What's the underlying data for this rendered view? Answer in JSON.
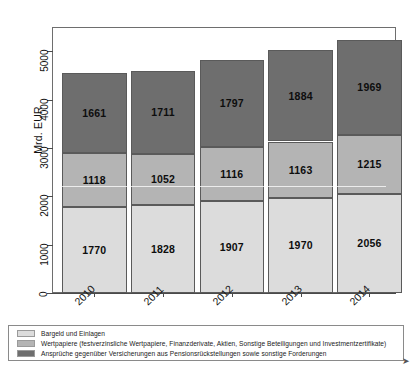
{
  "chart_data": {
    "type": "bar",
    "stacked": true,
    "title": "",
    "subtitle": "",
    "xlabel": "",
    "ylabel": "Mrd. EUR",
    "categories": [
      "2010",
      "2011",
      "2012",
      "2013",
      "2014"
    ],
    "ylim": [
      0,
      5500
    ],
    "yticks": [
      0,
      1000,
      2000,
      3000,
      4000,
      5000
    ],
    "ytick_labels": [
      "0",
      "1000",
      "2000",
      "3000",
      "4000",
      "5000"
    ],
    "grid": false,
    "legend_position": "below-plot",
    "series": [
      {
        "name": "Bargeld und Einlagen",
        "color": "#dcdcdc",
        "values": [
          1770,
          1828,
          1907,
          1970,
          2056
        ]
      },
      {
        "name": "Wertpapiere (festverzinsliche Wertpapiere, Finanzderivate, Aktien, Sonstige Beteiligungen und Investmentzertifikate)",
        "color": "#b4b4b4",
        "values": [
          1118,
          1052,
          1116,
          1163,
          1215
        ]
      },
      {
        "name": "Ansprüche gegenüber Versicherungen aus Pensionsrückstellungen sowie sonstige Forderungen",
        "color": "#6e6e6e",
        "values": [
          1661,
          1711,
          1797,
          1884,
          1969
        ]
      }
    ],
    "totals": [
      4549,
      4591,
      4820,
      5017,
      5240
    ]
  },
  "axis": {
    "y_title": "Mrd. EUR"
  },
  "legend": {
    "items": [
      {
        "label": "Bargeld und Einlagen",
        "color": "#dcdcdc"
      },
      {
        "label": "Wertpapiere (festverzinsliche Wertpapiere, Finanzderivate, Aktien, Sonstige Beteiligungen und Investmentzertifikate)",
        "color": "#b4b4b4"
      },
      {
        "label": "Ansprüche gegenüber Versicherungen aus Pensionsrückstellungen sowie sonstige Forderungen",
        "color": "#6e6e6e"
      }
    ]
  }
}
